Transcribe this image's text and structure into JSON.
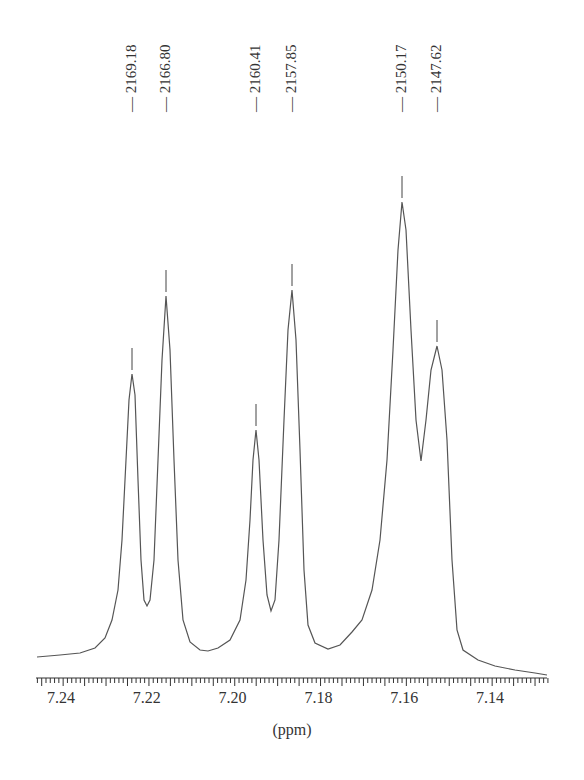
{
  "chart_data": {
    "type": "line",
    "title": "",
    "xlabel": "(ppm)",
    "ylabel": "",
    "xlim": [
      7.2515,
      7.1296
    ],
    "x_reversed": true,
    "grid": false,
    "legend": null,
    "x_ticks": [
      "7.24",
      "7.22",
      "7.20",
      "7.18",
      "7.16",
      "7.14"
    ],
    "x_tick_values": [
      7.24,
      7.22,
      7.2,
      7.18,
      7.16,
      7.14
    ],
    "peaks": [
      {
        "label": "2169.18",
        "ppm": 7.228,
        "rel_height": 0.55
      },
      {
        "label": "2166.80",
        "ppm": 7.22,
        "rel_height": 0.8
      },
      {
        "label": "2160.41",
        "ppm": 7.198,
        "rel_height": 0.5
      },
      {
        "label": "2157.85",
        "ppm": 7.19,
        "rel_height": 0.8
      },
      {
        "label": "2150.17",
        "ppm": 7.164,
        "rel_height": 1.0
      },
      {
        "label": "2147.62",
        "ppm": 7.155,
        "rel_height": 0.66
      }
    ],
    "annotation": "peak labels in Hz"
  },
  "axis": {
    "xlabel": "(ppm)"
  }
}
